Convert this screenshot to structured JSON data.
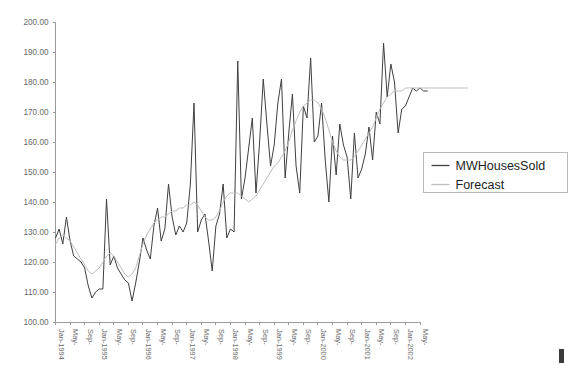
{
  "chart_data": {
    "type": "line",
    "title": "",
    "xlabel": "",
    "ylabel": "",
    "ylim": [
      100,
      200
    ],
    "ytick_step": 10,
    "ytick_labels": [
      "200.00",
      "190.00",
      "180.00",
      "170.00",
      "160.00",
      "150.00",
      "140.00",
      "130.00",
      "120.00",
      "110.00",
      "100.00"
    ],
    "ytick_values": [
      200,
      190,
      180,
      170,
      160,
      150,
      140,
      130,
      120,
      110,
      100
    ],
    "grid": false,
    "legend_position": "right",
    "x_labels_rotated": true,
    "x_tick_labels": [
      "Jan-1994",
      "May-",
      "Sep-",
      "Jan-1995",
      "May-",
      "Sep-",
      "Jan-1996",
      "May-",
      "Sep-",
      "Jan-1997",
      "May-",
      "Sep-",
      "Jan-1998",
      "May-",
      "Sep-",
      "Jan-1999",
      "May-",
      "Sep-",
      "Jan-2000",
      "May-",
      "Sep-",
      "Jan-2001",
      "May-",
      "Sep-",
      "Jan-2002",
      "May-"
    ],
    "x_tick_step_months": 4,
    "x_start": "Jan-1994",
    "x_end": "Jul-2002",
    "series": [
      {
        "name": "MWHousesSold",
        "color": "#3f3f3f",
        "values": [
          128,
          131,
          126,
          135,
          127,
          122,
          121,
          120,
          118,
          112,
          108,
          110,
          111,
          111,
          141,
          119,
          122,
          118,
          116,
          114,
          113,
          107,
          113,
          120,
          128,
          124,
          121,
          132,
          138,
          127,
          131,
          146,
          135,
          129,
          132,
          130,
          133,
          146,
          173,
          130,
          134,
          136,
          127,
          117,
          132,
          136,
          146,
          128,
          131,
          130,
          187,
          141,
          148,
          158,
          168,
          143,
          160,
          181,
          166,
          152,
          159,
          173,
          181,
          148,
          163,
          176,
          152,
          143,
          172,
          168,
          188,
          160,
          162,
          173,
          154,
          140,
          162,
          149,
          166,
          159,
          155,
          141,
          163,
          148,
          151,
          156,
          165,
          154,
          170,
          166,
          193,
          175,
          186,
          180,
          163,
          171,
          172,
          175,
          178,
          177,
          178,
          177,
          177
        ]
      },
      {
        "name": "Forecast",
        "color": "#bdbdbd",
        "values": [
          126,
          128,
          129,
          128,
          127,
          125,
          123,
          121,
          119,
          117,
          116,
          117,
          118,
          120,
          122,
          123,
          122,
          120,
          118,
          116,
          115,
          116,
          118,
          122,
          126,
          129,
          131,
          133,
          134,
          135,
          135,
          136,
          137,
          137,
          138,
          138,
          139,
          139,
          140,
          139,
          137,
          135,
          134,
          134,
          135,
          137,
          140,
          142,
          143,
          143,
          143,
          142,
          141,
          140,
          141,
          142,
          144,
          146,
          148,
          150,
          152,
          153,
          155,
          157,
          160,
          164,
          167,
          170,
          172,
          173,
          174,
          174,
          173,
          171,
          168,
          164,
          160,
          157,
          155,
          154,
          154,
          154,
          155,
          157,
          159,
          161,
          163,
          165,
          168,
          171,
          173,
          175,
          176,
          177,
          177,
          177,
          178,
          178,
          178,
          178,
          178,
          178,
          178,
          178,
          178,
          178,
          178,
          178,
          178,
          178,
          178,
          178,
          178,
          178
        ]
      }
    ]
  },
  "legend": {
    "items": [
      {
        "label": "MWHousesSold",
        "color": "#3f3f3f"
      },
      {
        "label": "Forecast",
        "color": "#bdbdbd"
      }
    ]
  },
  "axes": {
    "y_axis_name": "value-axis",
    "x_axis_name": "category-axis"
  }
}
